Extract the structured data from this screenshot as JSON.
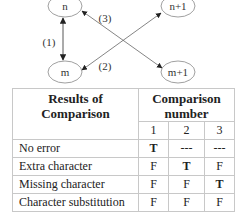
{
  "diagram": {
    "nodes": [
      {
        "id": "n",
        "label": "n"
      },
      {
        "id": "n+1",
        "label": "n+1"
      },
      {
        "id": "m",
        "label": "m"
      },
      {
        "id": "m+1",
        "label": "m+1"
      }
    ],
    "edges": [
      {
        "from": "n",
        "to": "m",
        "label": "(1)",
        "bidirectional": true
      },
      {
        "from": "m",
        "to": "n+1",
        "label": "(2)",
        "bidirectional": true
      },
      {
        "from": "n",
        "to": "m+1",
        "label": "(3)",
        "bidirectional": true
      }
    ]
  },
  "table": {
    "header_left": [
      "Results of",
      "Comparison"
    ],
    "header_right": [
      "Comparison",
      "number"
    ],
    "columns": [
      "1",
      "2",
      "3"
    ],
    "rows": [
      {
        "label": "No error",
        "values": [
          "T",
          "---",
          "---"
        ],
        "bold": [
          true,
          false,
          false
        ]
      },
      {
        "label": "Extra character",
        "values": [
          "F",
          "T",
          "F"
        ],
        "bold": [
          false,
          true,
          false
        ]
      },
      {
        "label": "Missing character",
        "values": [
          "F",
          "F",
          "T"
        ],
        "bold": [
          false,
          false,
          true
        ]
      },
      {
        "label": "Character substitution",
        "values": [
          "F",
          "F",
          "F"
        ],
        "bold": [
          false,
          false,
          false
        ]
      }
    ]
  }
}
